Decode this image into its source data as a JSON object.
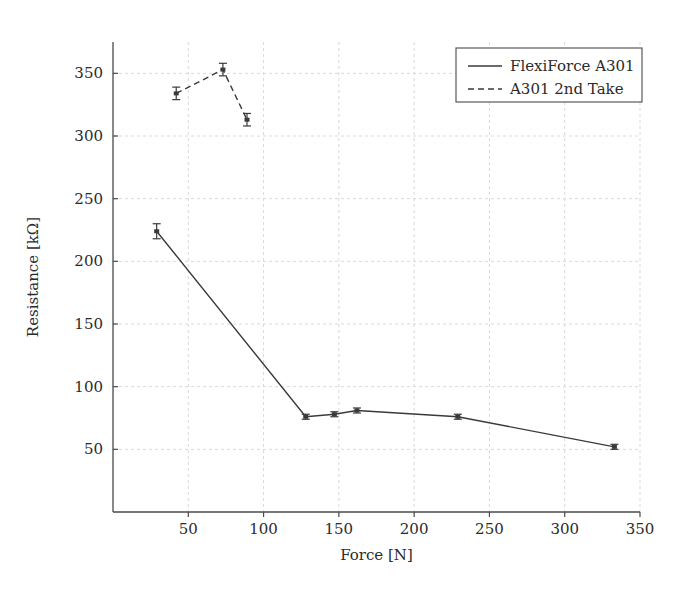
{
  "chart_data": {
    "type": "line",
    "title": "",
    "xlabel": "Force [N]",
    "ylabel": "Resistance [kΩ]",
    "xlim": [
      0,
      350
    ],
    "ylim": [
      0,
      375
    ],
    "xticks": [
      50,
      100,
      150,
      200,
      250,
      300,
      350
    ],
    "yticks": [
      50,
      100,
      150,
      200,
      250,
      300,
      350
    ],
    "grid": true,
    "legend_position": "top-right",
    "error_bars": true,
    "series": [
      {
        "name": "FlexiForce A301",
        "style": "solid",
        "color": "#3a3a3a",
        "x": [
          29,
          128,
          147,
          162,
          229,
          333
        ],
        "y": [
          224,
          76,
          78,
          81,
          76,
          52
        ],
        "yerr": [
          6,
          2,
          2,
          2,
          2,
          2
        ]
      },
      {
        "name": "A301 2nd Take",
        "style": "dashed",
        "color": "#3a3a3a",
        "x": [
          42,
          73,
          89
        ],
        "y": [
          334,
          353,
          313
        ],
        "yerr": [
          5,
          5,
          5
        ]
      }
    ]
  },
  "legend": {
    "entries": [
      {
        "label": "FlexiForce A301",
        "style": "solid"
      },
      {
        "label": "A301 2nd Take",
        "style": "dashed"
      }
    ]
  },
  "axes": {
    "x_title": "Force [N]",
    "y_title": "Resistance [kΩ]",
    "x_tick_labels": [
      "50",
      "100",
      "150",
      "200",
      "250",
      "300",
      "350"
    ],
    "y_tick_labels": [
      "50",
      "100",
      "150",
      "200",
      "250",
      "300",
      "350"
    ]
  },
  "colors": {
    "line": "#3a3a3a",
    "axis": "#4a4a4a",
    "grid": "#d9d9d9",
    "background": "#ffffff"
  }
}
